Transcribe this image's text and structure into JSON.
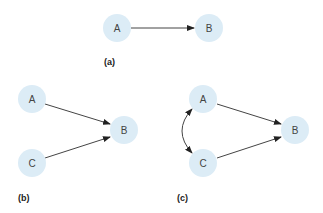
{
  "colors": {
    "node_fill": "#dcecf6",
    "edge": "#333333",
    "text": "#444444"
  },
  "panels": [
    {
      "label": "(a)",
      "nodes": [
        {
          "id": "A",
          "label": "A"
        },
        {
          "id": "B",
          "label": "B"
        }
      ],
      "edges": [
        {
          "from": "A",
          "to": "B",
          "type": "directed"
        }
      ]
    },
    {
      "label": "(b)",
      "nodes": [
        {
          "id": "A",
          "label": "A"
        },
        {
          "id": "B",
          "label": "B"
        },
        {
          "id": "C",
          "label": "C"
        }
      ],
      "edges": [
        {
          "from": "A",
          "to": "B",
          "type": "directed"
        },
        {
          "from": "C",
          "to": "B",
          "type": "directed"
        }
      ]
    },
    {
      "label": "(c)",
      "nodes": [
        {
          "id": "A",
          "label": "A"
        },
        {
          "id": "B",
          "label": "B"
        },
        {
          "id": "C",
          "label": "C"
        }
      ],
      "edges": [
        {
          "from": "A",
          "to": "B",
          "type": "directed"
        },
        {
          "from": "C",
          "to": "B",
          "type": "directed"
        },
        {
          "from": "A",
          "to": "C",
          "type": "bidirected-curved"
        }
      ]
    }
  ]
}
